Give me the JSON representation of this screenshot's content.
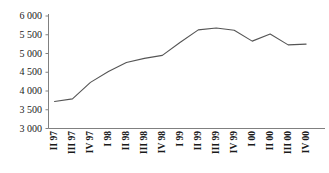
{
  "chart_data": {
    "type": "line",
    "title": "",
    "subtitle": "",
    "xlabel": "",
    "ylabel": "",
    "categories": [
      "II 97",
      "III 97",
      "IV 97",
      "I 98",
      "II 98",
      "III 98",
      "IV 98",
      "I 99",
      "II 99",
      "III 99",
      "IV 99",
      "I 00",
      "II 00",
      "III 00",
      "IV 00"
    ],
    "values": [
      3720,
      3790,
      4230,
      4520,
      4760,
      4870,
      4950,
      5300,
      5630,
      5680,
      5620,
      5330,
      5520,
      5230,
      5250
    ],
    "series": [
      {
        "name": "series-1",
        "values": [
          3720,
          3790,
          4230,
          4520,
          4760,
          4870,
          4950,
          5300,
          5630,
          5680,
          5620,
          5330,
          5520,
          5230,
          5250
        ]
      }
    ],
    "ylim": [
      3000,
      6000
    ],
    "yticks": [
      3000,
      3500,
      4000,
      4500,
      5000,
      5500,
      6000
    ],
    "ytick_labels": [
      "3 000",
      "3 500",
      "4 000",
      "4 500",
      "5 000",
      "5 500",
      "6 000"
    ],
    "xtick_labels": [
      "II 97",
      "III 97",
      "IV 97",
      "I 98",
      "II 98",
      "III 98",
      "IV 98",
      "I 99",
      "II 99",
      "III 99",
      "IV 99",
      "I 00",
      "II 00",
      "III 00",
      "IV 00"
    ],
    "grid": false,
    "legend": "none",
    "line_color": "#555555",
    "axis_color": "#808080"
  },
  "axis": {
    "y_label_top": "6 000",
    "y_label_bottom": "3 000"
  }
}
